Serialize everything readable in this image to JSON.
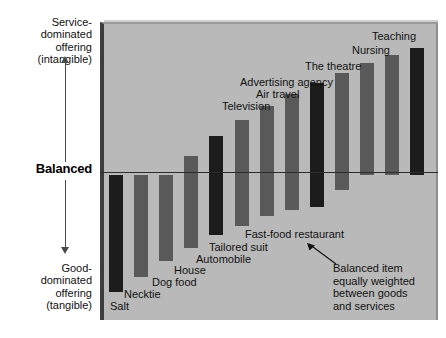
{
  "axis": {
    "top_label": "Service-\ndominated\noffering\n(intangible)",
    "middle_label": "Balanced",
    "bottom_label": "Good-\ndominated\noffering\n(tangible)"
  },
  "annotation": {
    "text": "Balanced item\nequally weighted\nbetween goods\nand services"
  },
  "colors": {
    "panel": "#b9b9b9",
    "bar_dark": "#1c1c1c",
    "bar_medium": "#595959",
    "balanced_line": "#2c2c2c",
    "panel_edge": "#3d3d3d"
  },
  "chart_data": {
    "type": "bar",
    "title": "",
    "xlabel": "",
    "ylabel": "Service-dominated offering (intangible) to Good-dominated offering (tangible)",
    "orientation": "vertical",
    "baseline": "Balanced",
    "grid": false,
    "legend": "none",
    "ylim": [
      -100,
      100
    ],
    "note": "Each bar spans from its good-dominated extent (negative) to its service-dominated extent (positive) across the Balanced axis.",
    "categories": [
      "Salt",
      "Necktie",
      "Dog food",
      "House",
      "Automobile",
      "Tailored suit",
      "Fast-food restaurant",
      "Television",
      "Air travel",
      "Advertising agency",
      "The theatre",
      "Nursing",
      "Teaching"
    ],
    "bars": [
      {
        "label": "Salt",
        "shade": "dark",
        "top": -2,
        "bottom": -95
      },
      {
        "label": "Necktie",
        "shade": "medium",
        "top": -2,
        "bottom": -83
      },
      {
        "label": "Dog food",
        "shade": "medium",
        "top": -2,
        "bottom": -71
      },
      {
        "label": "House",
        "shade": "medium",
        "top": 13,
        "bottom": -60
      },
      {
        "label": "Automobile",
        "shade": "dark",
        "top": 29,
        "bottom": -50
      },
      {
        "label": "Tailored suit",
        "shade": "medium",
        "top": 42,
        "bottom": -43
      },
      {
        "label": "Fast-food restaurant",
        "shade": "medium",
        "top": 53,
        "bottom": -35
      },
      {
        "label": "Television",
        "shade": "medium",
        "top": 63,
        "bottom": -30
      },
      {
        "label": "Air travel",
        "shade": "dark",
        "top": 72,
        "bottom": -28
      },
      {
        "label": "Advertising agency",
        "shade": "medium",
        "top": 80,
        "bottom": -14
      },
      {
        "label": "The theatre",
        "shade": "medium",
        "top": 88,
        "bottom": -2
      },
      {
        "label": "Nursing",
        "shade": "medium",
        "top": 94,
        "bottom": -2
      },
      {
        "label": "Teaching",
        "shade": "dark",
        "top": 100,
        "bottom": -2
      }
    ],
    "bar_labels": [
      {
        "text": "Salt",
        "position": "below-bar"
      },
      {
        "text": "Necktie",
        "position": "below-bar"
      },
      {
        "text": "Dog food",
        "position": "below-bar"
      },
      {
        "text": "House",
        "position": "below-bar"
      },
      {
        "text": "Automobile",
        "position": "below-bar"
      },
      {
        "text": "Tailored suit",
        "position": "below-bar"
      },
      {
        "text": "Fast-food restaurant",
        "position": "below-bar"
      },
      {
        "text": "Television",
        "position": "above-bar"
      },
      {
        "text": "Air travel",
        "position": "above-bar"
      },
      {
        "text": "Advertising agency",
        "position": "above-bar"
      },
      {
        "text": "The theatre",
        "position": "above-bar"
      },
      {
        "text": "Nursing",
        "position": "above-bar"
      },
      {
        "text": "Teaching",
        "position": "above-bar"
      }
    ]
  }
}
